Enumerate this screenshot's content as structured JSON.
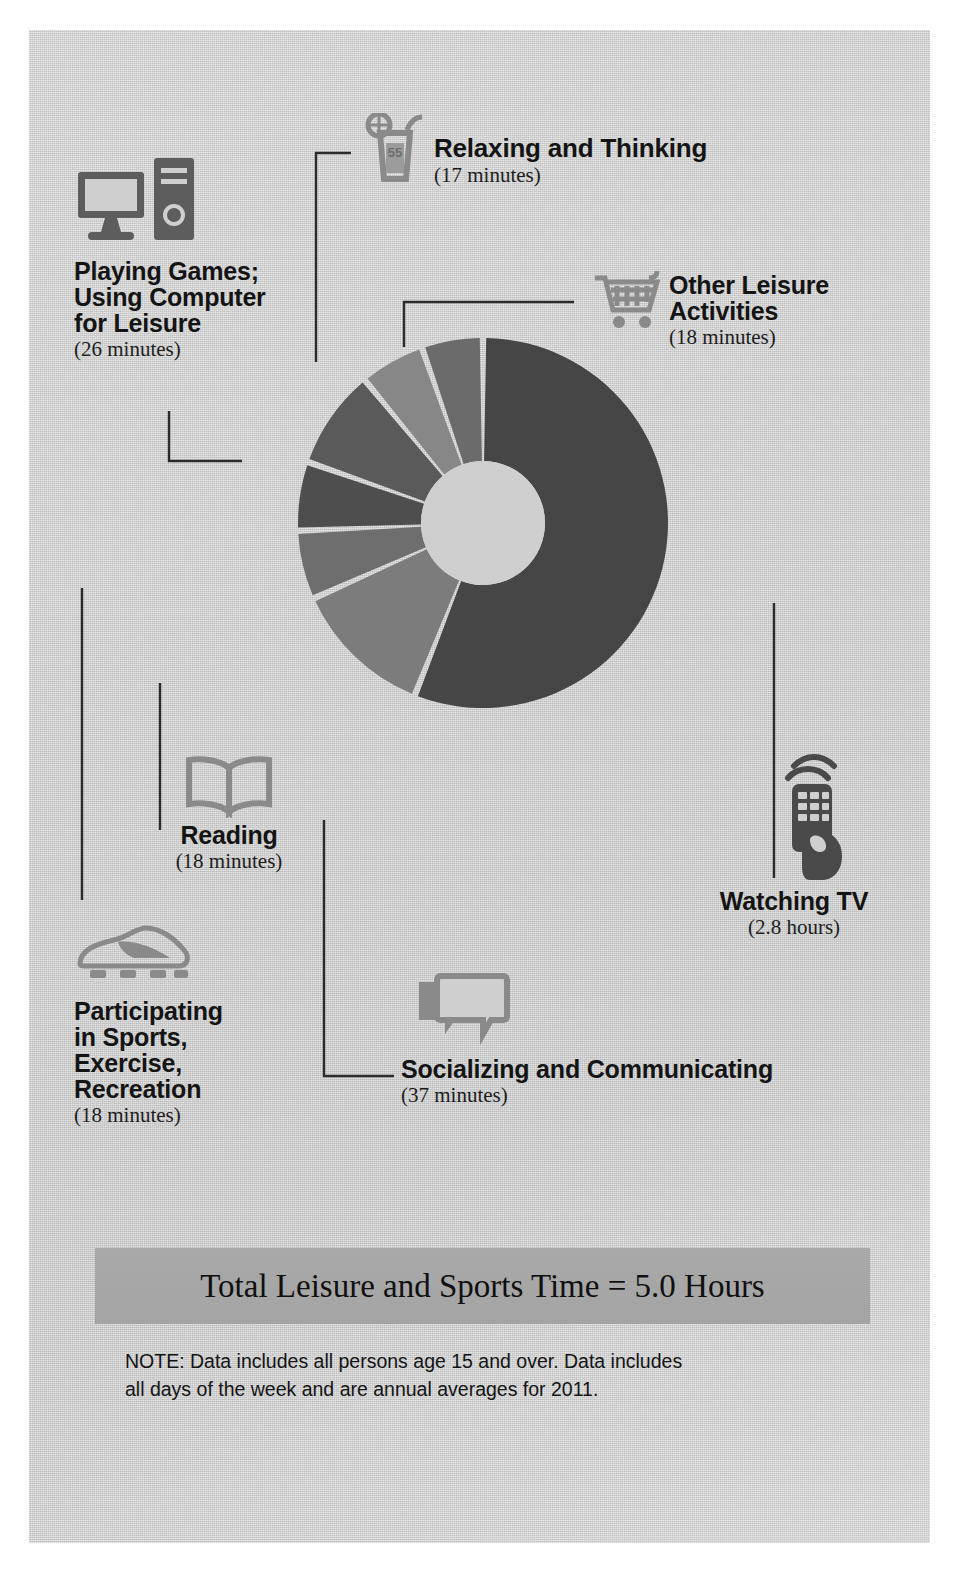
{
  "chart_data": {
    "type": "pie",
    "total_label": "Total Leisure and Sports Time = 5.0 Hours",
    "total_hours": 5.0,
    "units": "minutes per day",
    "grid": false,
    "legend_position": "callouts",
    "categories": [
      "Watching TV",
      "Socializing and Communicating",
      "Participating in Sports, Exercise, Recreation",
      "Reading",
      "Playing Games; Using Computer for Leisure",
      "Relaxing and Thinking",
      "Other Leisure Activities"
    ],
    "values": [
      168,
      37,
      18,
      18,
      26,
      17,
      18
    ],
    "value_labels": [
      "2.8 hours",
      "37 minutes",
      "18 minutes",
      "18 minutes",
      "26 minutes",
      "17 minutes",
      "18 minutes"
    ],
    "slices": [
      {
        "label": "Watching TV",
        "value_label": "(2.8 hours)",
        "minutes": 168,
        "share_pct": 56.0,
        "color": "#464646",
        "start_deg": 0,
        "end_deg": 201.6
      },
      {
        "label": "Socializing and Communicating",
        "value_label": "(37 minutes)",
        "minutes": 37,
        "share_pct": 12.3,
        "color": "#7c7c7c",
        "start_deg": 201.6,
        "end_deg": 246.0
      },
      {
        "label": "Participating in Sports, Exercise, Recreation",
        "value_label": "(18 minutes)",
        "minutes": 18,
        "share_pct": 6.0,
        "color": "#6e6e6e",
        "start_deg": 246.0,
        "end_deg": 267.6
      },
      {
        "label": "Reading",
        "value_label": "(18 minutes)",
        "minutes": 18,
        "share_pct": 6.0,
        "color": "#4e4e4e",
        "start_deg": 267.6,
        "end_deg": 289.2
      },
      {
        "label": "Playing Games; Using Computer for Leisure",
        "value_label": "(26 minutes)",
        "minutes": 26,
        "share_pct": 8.7,
        "color": "#5a5a5a",
        "start_deg": 289.2,
        "end_deg": 320.4
      },
      {
        "label": "Relaxing and Thinking",
        "value_label": "(17 minutes)",
        "minutes": 17,
        "share_pct": 5.7,
        "color": "#878787",
        "start_deg": 320.4,
        "end_deg": 340.8
      },
      {
        "label": "Other Leisure Activities",
        "value_label": "(18 minutes)",
        "minutes": 18,
        "share_pct": 6.0,
        "color": "#6b6b6b",
        "start_deg": 340.8,
        "end_deg": 360
      }
    ]
  },
  "callouts": {
    "relaxing": {
      "title": "Relaxing and Thinking",
      "value": "(17 minutes)",
      "icon": "drink-glass-icon"
    },
    "other": {
      "title_line1": "Other Leisure",
      "title_line2": "Activities",
      "value": "(18 minutes)",
      "icon": "shopping-cart-icon"
    },
    "computer": {
      "title_line1": "Playing Games;",
      "title_line2": "Using Computer",
      "title_line3": "for Leisure",
      "value": "(26 minutes)",
      "icon": "desktop-computer-icon"
    },
    "reading": {
      "title": "Reading",
      "value": "(18 minutes)",
      "icon": "open-book-icon"
    },
    "sports": {
      "title_line1": "Participating",
      "title_line2": "in Sports,",
      "title_line3": "Exercise,",
      "title_line4": "Recreation",
      "value": "(18 minutes)",
      "icon": "sports-cleat-icon"
    },
    "socializing": {
      "title": "Socializing and Communicating",
      "value": "(37 minutes)",
      "icon": "speech-bubbles-icon"
    },
    "tv": {
      "title": "Watching TV",
      "value": "(2.8 hours)",
      "icon": "remote-control-hand-icon"
    }
  },
  "banner": {
    "text": "Total Leisure and Sports Time = 5.0 Hours"
  },
  "note": {
    "line1": "NOTE: Data includes all persons age 15 and over. Data includes",
    "line2": "all days of the week and are annual averages for 2011."
  },
  "colors": {
    "background": "#cfcfcf",
    "banner": "#a6a6a6",
    "icon_gray": "#8c8c8c",
    "icon_dark": "#555555",
    "text": "#141414",
    "slice_gap": "#cfcfcf"
  }
}
